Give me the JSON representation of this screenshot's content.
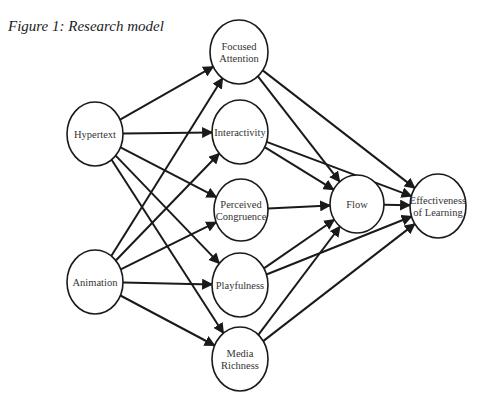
{
  "figure": {
    "caption": "Figure 1: Research model"
  },
  "diagram": {
    "nodes": [
      {
        "id": "hypertext",
        "lines": [
          "Hypertext"
        ],
        "cx": 95,
        "cy": 134,
        "rx": 28,
        "ry": 32
      },
      {
        "id": "animation",
        "lines": [
          "Animation"
        ],
        "cx": 95,
        "cy": 282,
        "rx": 28,
        "ry": 32
      },
      {
        "id": "focused_attention",
        "lines": [
          "Focused",
          "Attention"
        ],
        "cx": 239,
        "cy": 52,
        "rx": 29,
        "ry": 32
      },
      {
        "id": "interactivity",
        "lines": [
          "Interactivity"
        ],
        "cx": 240,
        "cy": 132,
        "rx": 28,
        "ry": 32
      },
      {
        "id": "perceived_congruence",
        "lines": [
          "Perceived",
          "Congruence"
        ],
        "cx": 241,
        "cy": 210,
        "rx": 27,
        "ry": 31
      },
      {
        "id": "playfulness",
        "lines": [
          "Playfulness"
        ],
        "cx": 240,
        "cy": 285,
        "rx": 28,
        "ry": 32
      },
      {
        "id": "media_richness",
        "lines": [
          "Media",
          "Richness"
        ],
        "cx": 240,
        "cy": 359,
        "rx": 28,
        "ry": 32
      },
      {
        "id": "flow",
        "lines": [
          "Flow"
        ],
        "cx": 357,
        "cy": 204,
        "rx": 27,
        "ry": 29
      },
      {
        "id": "effectiveness",
        "lines": [
          "Effectiveness",
          "of Learning"
        ],
        "cx": 438,
        "cy": 206,
        "rx": 28,
        "ry": 32
      }
    ],
    "edges": [
      {
        "from": "hypertext",
        "to": "focused_attention"
      },
      {
        "from": "hypertext",
        "to": "interactivity"
      },
      {
        "from": "hypertext",
        "to": "perceived_congruence"
      },
      {
        "from": "hypertext",
        "to": "playfulness"
      },
      {
        "from": "hypertext",
        "to": "media_richness"
      },
      {
        "from": "animation",
        "to": "focused_attention"
      },
      {
        "from": "animation",
        "to": "interactivity"
      },
      {
        "from": "animation",
        "to": "perceived_congruence"
      },
      {
        "from": "animation",
        "to": "playfulness"
      },
      {
        "from": "animation",
        "to": "media_richness"
      },
      {
        "from": "focused_attention",
        "to": "flow"
      },
      {
        "from": "focused_attention",
        "to": "effectiveness"
      },
      {
        "from": "interactivity",
        "to": "flow"
      },
      {
        "from": "interactivity",
        "to": "effectiveness"
      },
      {
        "from": "perceived_congruence",
        "to": "flow"
      },
      {
        "from": "playfulness",
        "to": "flow"
      },
      {
        "from": "playfulness",
        "to": "effectiveness"
      },
      {
        "from": "media_richness",
        "to": "flow"
      },
      {
        "from": "media_richness",
        "to": "effectiveness"
      },
      {
        "from": "flow",
        "to": "effectiveness"
      }
    ],
    "colors": {
      "stroke": "#1a1a1a",
      "text": "#333333",
      "background": "#ffffff"
    }
  }
}
